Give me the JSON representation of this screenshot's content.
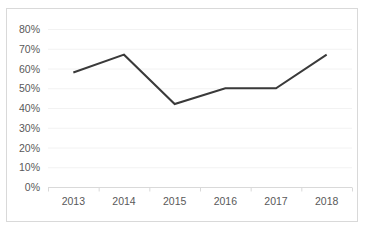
{
  "chart_data": {
    "type": "line",
    "title": "",
    "xlabel": "",
    "ylabel": "",
    "categories": [
      "2013",
      "2014",
      "2015",
      "2016",
      "2017",
      "2018"
    ],
    "values": [
      58,
      67,
      42,
      50,
      50,
      67
    ],
    "series": [
      {
        "name": "",
        "values": [
          58,
          67,
          42,
          50,
          50,
          67
        ]
      }
    ],
    "ylim": [
      0,
      80
    ],
    "ytick_values": [
      0,
      10,
      20,
      30,
      40,
      50,
      60,
      70,
      80
    ],
    "ytick_labels": [
      "0%",
      "10%",
      "20%",
      "30%",
      "40%",
      "50%",
      "60%",
      "70%",
      "80%"
    ],
    "grid": true,
    "grid_axis": "y",
    "legend": false,
    "legend_position": "none",
    "value_suffix": "%",
    "colors": {
      "line": "#3a3a3a",
      "gridline": "#f2f2f2",
      "axis": "#d9d9d9",
      "border": "#d9d9d9",
      "tick_label": "#595959",
      "background": "#ffffff"
    },
    "line_width": 2
  }
}
